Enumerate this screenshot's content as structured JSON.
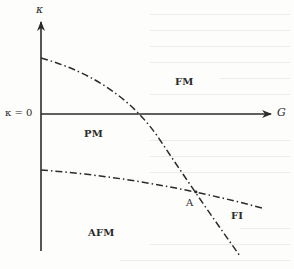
{
  "diagram": {
    "type": "phase-diagram",
    "axes": {
      "y_label": "κ",
      "x_label": "G",
      "origin_label": "κ = 0"
    },
    "regions": [
      {
        "id": "fm",
        "label": "FM"
      },
      {
        "id": "pm",
        "label": "PM"
      },
      {
        "id": "afm",
        "label": "AFM"
      },
      {
        "id": "fi",
        "label": "FI"
      }
    ],
    "point": {
      "label": "A"
    },
    "boundaries": [
      {
        "name": "FM-PM boundary",
        "style": "dash-dot"
      },
      {
        "name": "PM-AFM boundary",
        "style": "dash-dot"
      }
    ],
    "colors": {
      "ink": "#2b2b2b",
      "background": "#fdfdfb"
    }
  }
}
